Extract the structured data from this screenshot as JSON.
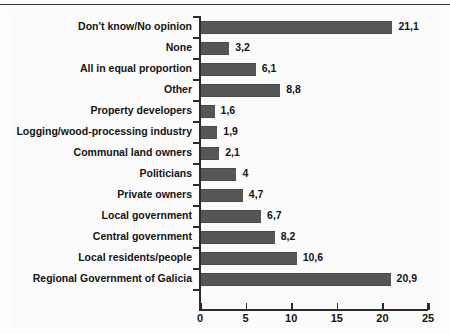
{
  "chart_data": {
    "type": "bar",
    "orientation": "horizontal",
    "title": "",
    "subtitle": "",
    "xlabel": "",
    "ylabel": "",
    "xlim": [
      0,
      25
    ],
    "xticks": [
      0,
      5,
      10,
      15,
      20,
      25
    ],
    "xtick_labels": [
      "0",
      "5",
      "10",
      "15",
      "20",
      "25"
    ],
    "grid": false,
    "legend": false,
    "decimal_separator": ",",
    "bar_color": "#565656",
    "axis_color": "#2b2b2b",
    "background_color": "#fdfdfd",
    "categories": [
      "Don't know/No opinion",
      "None",
      "All in equal proportion",
      "Other",
      "Property developers",
      "Logging/wood-processing industry",
      "Communal land owners",
      "Politicians",
      "Private owners",
      "Local government",
      "Central government",
      "Local residents/people",
      "Regional Government of Galicia"
    ],
    "values": [
      21.1,
      3.2,
      6.1,
      8.8,
      1.6,
      1.9,
      2.1,
      4,
      4.7,
      6.7,
      8.2,
      10.6,
      20.9
    ],
    "value_labels": [
      "21,1",
      "3,2",
      "6,1",
      "8,8",
      "1,6",
      "1,9",
      "2,1",
      "4",
      "4,7",
      "6,7",
      "8,2",
      "10,6",
      "20,9"
    ]
  }
}
